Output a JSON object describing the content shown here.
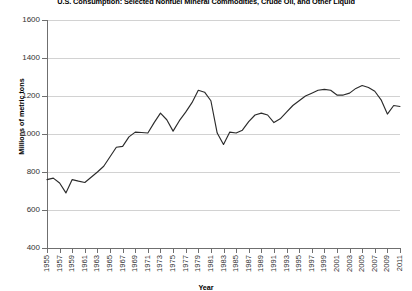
{
  "chart_data": {
    "type": "line",
    "title": "U.S. Consumption: Selected Nonfuel Mineral Commodities,  Crude Oil, and Other Liquid",
    "xlabel": "Year",
    "ylabel": "Millions of metric tons",
    "ylim": [
      400,
      1600
    ],
    "yticks": [
      400,
      600,
      800,
      1000,
      1200,
      1400,
      1600
    ],
    "xlim": [
      1955,
      2011
    ],
    "grid": true,
    "legend": "none",
    "line_color": "#2b2b2b",
    "tick_labels_x": [
      "1955",
      "1957",
      "1959",
      "1961",
      "1963",
      "1965",
      "1967",
      "1969",
      "1971",
      "1973",
      "1975",
      "1977",
      "1979",
      "1981",
      "1983",
      "1985",
      "1987",
      "1989",
      "1991",
      "1993",
      "1995",
      "1997",
      "1999",
      "2001",
      "2003",
      "2005",
      "2007",
      "2009",
      "2011"
    ],
    "x": [
      1955,
      1956,
      1957,
      1958,
      1959,
      1960,
      1961,
      1962,
      1963,
      1964,
      1965,
      1966,
      1967,
      1968,
      1969,
      1970,
      1971,
      1972,
      1973,
      1974,
      1975,
      1976,
      1977,
      1978,
      1979,
      1980,
      1981,
      1982,
      1983,
      1984,
      1985,
      1986,
      1987,
      1988,
      1989,
      1990,
      1991,
      1992,
      1993,
      1994,
      1995,
      1996,
      1997,
      1998,
      1999,
      2000,
      2001,
      2002,
      2003,
      2004,
      2005,
      2006,
      2007,
      2008,
      2009,
      2010,
      2011
    ],
    "values": [
      760,
      768,
      742,
      690,
      760,
      752,
      745,
      772,
      800,
      830,
      880,
      930,
      935,
      985,
      1010,
      1008,
      1005,
      1060,
      1110,
      1075,
      1015,
      1070,
      1115,
      1165,
      1230,
      1220,
      1175,
      1005,
      945,
      1010,
      1005,
      1020,
      1065,
      1100,
      1110,
      1100,
      1060,
      1080,
      1115,
      1150,
      1175,
      1200,
      1215,
      1230,
      1235,
      1230,
      1205,
      1205,
      1215,
      1240,
      1255,
      1245,
      1225,
      1180,
      1105,
      1150,
      1145
    ]
  }
}
